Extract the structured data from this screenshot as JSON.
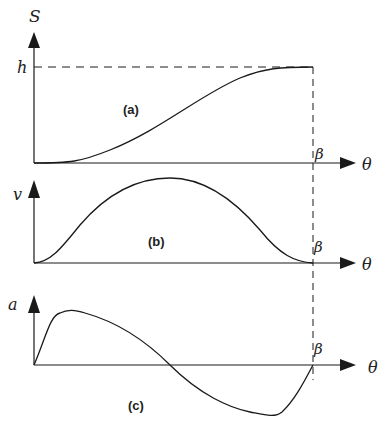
{
  "diagram": {
    "colors": {
      "line": "#1a1a1a",
      "background": "#ffffff"
    },
    "panels": [
      {
        "id": "a",
        "tag": "(a)",
        "y_label": "S",
        "x_label": "θ",
        "end_label": "β",
        "level_label": "h",
        "curve": "displacement rises smoothly from 0 to h over 0..β"
      },
      {
        "id": "b",
        "tag": "(b)",
        "y_label": "v",
        "x_label": "θ",
        "end_label": "β",
        "curve": "velocity bell-shaped, zero at 0 and β, peak at mid-rise"
      },
      {
        "id": "c",
        "tag": "(c)",
        "y_label": "a",
        "x_label": "θ",
        "end_label": "β",
        "curve": "acceleration positive lobe then negative lobe, crossing zero at mid-rise"
      }
    ]
  }
}
